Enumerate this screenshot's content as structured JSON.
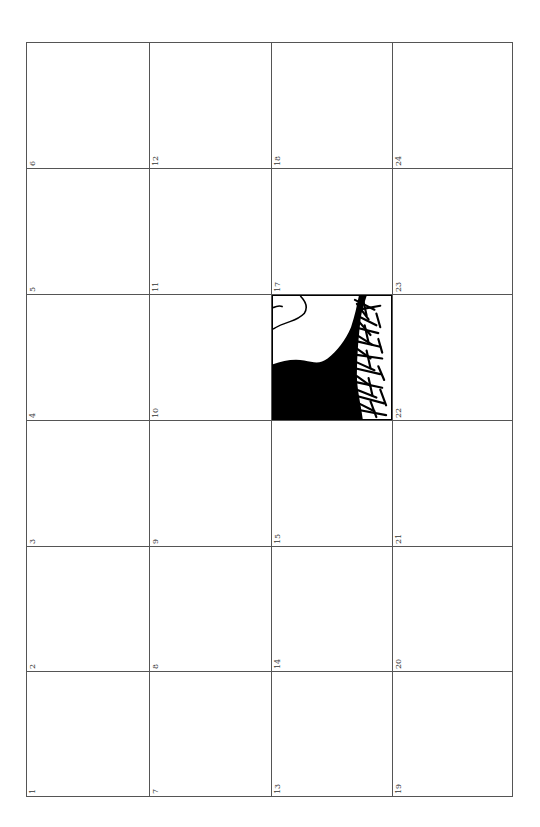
{
  "map_index": {
    "columns": 4,
    "rows": 6,
    "line_color": "#555555",
    "tiles": [
      {
        "label": "6",
        "col": 0,
        "row": 0
      },
      {
        "label": "12",
        "col": 1,
        "row": 0
      },
      {
        "label": "18",
        "col": 2,
        "row": 0
      },
      {
        "label": "24",
        "col": 3,
        "row": 0
      },
      {
        "label": "5",
        "col": 0,
        "row": 1
      },
      {
        "label": "11",
        "col": 1,
        "row": 1
      },
      {
        "label": "17",
        "col": 2,
        "row": 1
      },
      {
        "label": "23",
        "col": 3,
        "row": 1
      },
      {
        "label": "4",
        "col": 0,
        "row": 2
      },
      {
        "label": "10",
        "col": 1,
        "row": 2
      },
      {
        "label": "",
        "col": 2,
        "row": 2,
        "has_map": true
      },
      {
        "label": "22",
        "col": 3,
        "row": 2
      },
      {
        "label": "3",
        "col": 0,
        "row": 3
      },
      {
        "label": "9",
        "col": 1,
        "row": 3
      },
      {
        "label": "15",
        "col": 2,
        "row": 3
      },
      {
        "label": "21",
        "col": 3,
        "row": 3
      },
      {
        "label": "2",
        "col": 0,
        "row": 4
      },
      {
        "label": "8",
        "col": 1,
        "row": 4
      },
      {
        "label": "14",
        "col": 2,
        "row": 4
      },
      {
        "label": "20",
        "col": 3,
        "row": 4
      },
      {
        "label": "1",
        "col": 0,
        "row": 5
      },
      {
        "label": "7",
        "col": 1,
        "row": 5
      },
      {
        "label": "13",
        "col": 2,
        "row": 5
      },
      {
        "label": "19",
        "col": 3,
        "row": 5
      }
    ],
    "active_tile": {
      "col": 2,
      "row": 2,
      "land_color": "#000000",
      "water_color": "#ffffff",
      "features": [
        "landmass-fill",
        "coastline-hatching",
        "outlined-region"
      ]
    }
  }
}
